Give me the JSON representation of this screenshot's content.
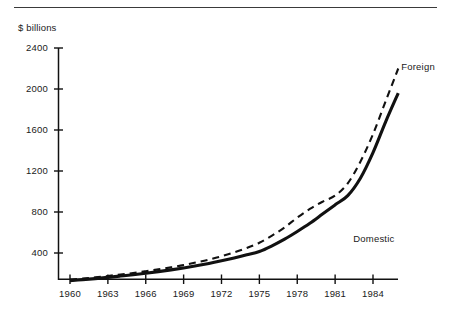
{
  "figure": {
    "top_rule": true,
    "background_color": "#ffffff",
    "line_color": "#111111"
  },
  "chart_data": {
    "type": "line",
    "title": "",
    "subtitle": "",
    "xlabel": "",
    "ylabel": "$ billions",
    "grid": false,
    "legend_position": "inline-annotation",
    "xlim": [
      1960,
      1986
    ],
    "ylim": [
      0,
      2400
    ],
    "x_tick_labels": [
      "1960",
      "1963",
      "1966",
      "1969",
      "1972",
      "1975",
      "1978",
      "1981",
      "1984"
    ],
    "x_ticks": [
      1960,
      1963,
      1966,
      1969,
      1972,
      1975,
      1978,
      1981,
      1984
    ],
    "y_tick_labels": [
      "2400",
      "2000",
      "1600",
      "1200",
      "800",
      "400"
    ],
    "y_ticks": [
      2400,
      2000,
      1600,
      1200,
      800,
      400
    ],
    "x": [
      1960,
      1961,
      1962,
      1963,
      1964,
      1965,
      1966,
      1967,
      1968,
      1969,
      1970,
      1971,
      1972,
      1973,
      1974,
      1975,
      1976,
      1977,
      1978,
      1979,
      1980,
      1981,
      1982,
      1983,
      1984,
      1985,
      1986
    ],
    "series": [
      {
        "name": "Foreign",
        "style": "dashed",
        "label": "Foreign",
        "values": [
          140,
          150,
          162,
          176,
          190,
          205,
          222,
          240,
          260,
          282,
          308,
          336,
          368,
          405,
          448,
          500,
          570,
          650,
          745,
          830,
          900,
          960,
          1080,
          1290,
          1560,
          1880,
          2200
        ]
      },
      {
        "name": "Domestic",
        "style": "solid",
        "label": "Domestic",
        "values": [
          130,
          140,
          150,
          162,
          175,
          188,
          202,
          218,
          235,
          254,
          275,
          298,
          324,
          352,
          382,
          415,
          470,
          535,
          610,
          690,
          780,
          870,
          960,
          1130,
          1380,
          1680,
          1960
        ]
      }
    ],
    "annotations": [
      {
        "text": "Foreign",
        "x": 1986,
        "y": 2210,
        "anchor": "start"
      },
      {
        "text": "Domestic",
        "x": 1982.2,
        "y": 530,
        "anchor": "start"
      }
    ]
  }
}
